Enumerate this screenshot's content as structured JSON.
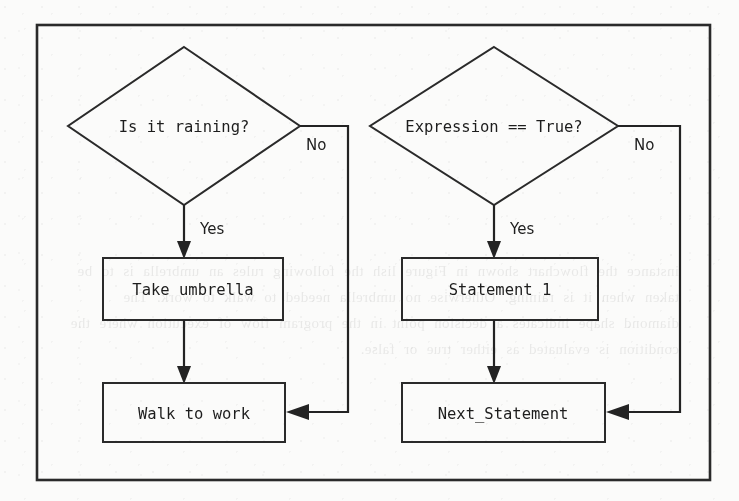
{
  "figure": {
    "kind": "flowchart",
    "background_color": "#fbfbfa",
    "ink_color": "#232323",
    "frame": {
      "x": 37,
      "y": 25,
      "width": 673,
      "height": 455
    }
  },
  "ghost_text": "instance the flowchart shown in Figure lish the following rules an umbrella is to be taken when it is raining. Otherwise no umbrella needed to walk to work. The diamond shape indicates a decision point in the program flow of execution where the condition is evaluated as either true or false.",
  "charts": [
    {
      "id": "left-flowchart",
      "title": "Real world decision",
      "nodes": [
        {
          "id": "decision-raining",
          "type": "decision",
          "label": "Is it raining?",
          "cx": 184,
          "cy": 126,
          "rx": 116,
          "ry": 79
        },
        {
          "id": "process-take-umbrella",
          "type": "process",
          "label": "Take umbrella",
          "x": 103,
          "y": 258,
          "width": 180,
          "height": 62
        },
        {
          "id": "process-walk-to-work",
          "type": "process",
          "label": "Walk to work",
          "x": 103,
          "y": 383,
          "width": 182,
          "height": 59
        }
      ],
      "edges": [
        {
          "id": "raining-yes",
          "label": "Yes",
          "from": "decision-raining",
          "to": "process-take-umbrella",
          "label_x": 200,
          "label_y": 234
        },
        {
          "id": "umbrella-to-walk",
          "label": "",
          "from": "process-take-umbrella",
          "to": "process-walk-to-work"
        },
        {
          "id": "raining-no",
          "label": "No",
          "from": "decision-raining",
          "to": "process-walk-to-work",
          "label_x": 306,
          "label_y": 150
        }
      ]
    },
    {
      "id": "right-flowchart",
      "title": "Code equivalent",
      "nodes": [
        {
          "id": "decision-expression",
          "type": "decision",
          "label": "Expression == True?",
          "cx": 494,
          "cy": 126,
          "rx": 124,
          "ry": 79
        },
        {
          "id": "process-statement-1",
          "type": "process",
          "label": "Statement 1",
          "x": 402,
          "y": 258,
          "width": 196,
          "height": 62
        },
        {
          "id": "process-next-statement",
          "type": "process",
          "label": "Next_Statement",
          "x": 402,
          "y": 383,
          "width": 203,
          "height": 59
        }
      ],
      "edges": [
        {
          "id": "expression-yes",
          "label": "Yes",
          "from": "decision-expression",
          "to": "process-statement-1",
          "label_x": 510,
          "label_y": 234
        },
        {
          "id": "statement1-to-next",
          "label": "",
          "from": "process-statement-1",
          "to": "process-next-statement"
        },
        {
          "id": "expression-no",
          "label": "No",
          "from": "decision-expression",
          "to": "process-next-statement",
          "label_x": 634,
          "label_y": 150
        }
      ]
    }
  ]
}
